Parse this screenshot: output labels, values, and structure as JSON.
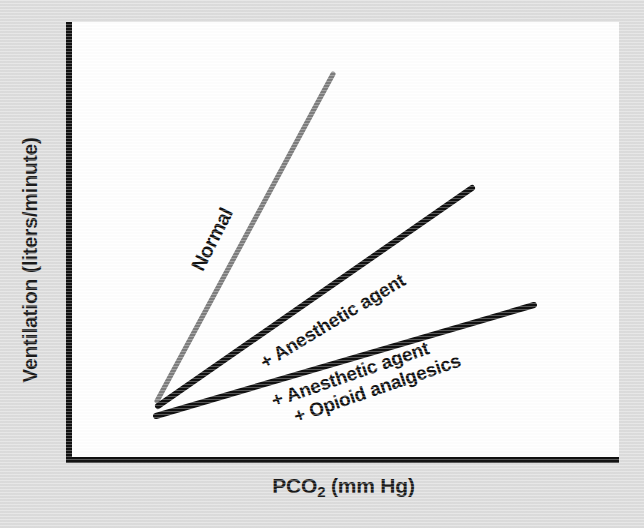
{
  "figure": {
    "background_color": "#dddddd",
    "plot_background_color": "#ffffff",
    "axis_color": "#111111"
  },
  "axes": {
    "y_title": "Ventilation (liters/minute)",
    "x_title_main": "PCO",
    "x_title_sub": "2",
    "x_title_tail": " (mm Hg)"
  },
  "labels": {
    "normal": "Normal",
    "anesthetic": "+ Anesthetic agent",
    "opioid_line1": "+ Anesthetic agent",
    "opioid_line2": "+ Opioid analgesics"
  },
  "chart_data": {
    "type": "line",
    "title": "",
    "xlabel": "PCO2 (mm Hg)",
    "ylabel": "Ventilation (liters/minute)",
    "xlim": [
      0,
      100
    ],
    "ylim": [
      0,
      100
    ],
    "grid": false,
    "legend_position": "inline-along-curves",
    "axis_ticks": [],
    "annotation_note": "Carbon dioxide ventilatory response curves; slope flattens and shifts right with anesthetic and opioid depression.",
    "series": [
      {
        "name": "Normal",
        "color": "#7d7d7d",
        "line_width": 5,
        "label": "Normal",
        "label_rotation_deg": -63,
        "x": [
          16,
          48
        ],
        "y": [
          14,
          88
        ],
        "pixel_start": [
          157,
          401
        ],
        "pixel_end": [
          333,
          74
        ],
        "relative_slope": 1.0
      },
      {
        "name": "+ Anesthetic agent",
        "color": "#111111",
        "line_width": 6,
        "label": "+ Anesthetic agent",
        "label_rotation_deg": -31,
        "x": [
          16,
          73
        ],
        "y": [
          13,
          62
        ],
        "pixel_start": [
          158,
          406
        ],
        "pixel_end": [
          472,
          188
        ],
        "relative_slope": 0.37
      },
      {
        "name": "+ Anesthetic agent + Opioid analgesics",
        "color": "#111111",
        "line_width": 6,
        "label": "+ Anesthetic agent / + Opioid analgesics",
        "label_rotation_deg": -19,
        "x": [
          16,
          84
        ],
        "y": [
          11,
          36
        ],
        "pixel_start": [
          156,
          416
        ],
        "pixel_end": [
          534,
          305
        ],
        "relative_slope": 0.16
      }
    ]
  }
}
